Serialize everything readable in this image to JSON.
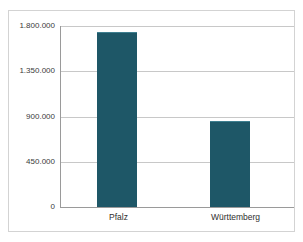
{
  "chart_data": {
    "type": "bar",
    "title": "",
    "subtitle": "",
    "xlabel": "",
    "ylabel": "",
    "categories": [
      "Pfalz",
      "Württemberg"
    ],
    "values": [
      1730000,
      845000
    ],
    "ylim": [
      0,
      1800000
    ],
    "yticks": [
      0,
      450000,
      900000,
      1350000,
      1800000
    ],
    "ytick_labels": [
      "0",
      "450.000",
      "900.000",
      "1.350.000",
      "1.800.000"
    ],
    "grid": true,
    "legend": "none",
    "series": [
      {
        "name": "",
        "values": [
          1730000,
          845000
        ],
        "color": "#1e5767"
      }
    ],
    "bar_color": "#1e5767",
    "gridline_color": "#c8c8c8",
    "axis_color": "#9a9a9a",
    "frame_color": "#d3d3d3",
    "background": "#ffffff"
  }
}
